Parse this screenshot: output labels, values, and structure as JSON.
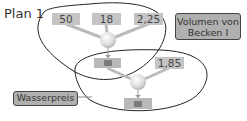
{
  "diagram": {
    "title": "Plan 1",
    "group1": {
      "inputs": [
        "50",
        "18",
        "2,25"
      ],
      "label": "Volumen von Becken I"
    },
    "group2": {
      "inputs": [
        "1,85"
      ],
      "label": "Wasserpreis"
    }
  }
}
